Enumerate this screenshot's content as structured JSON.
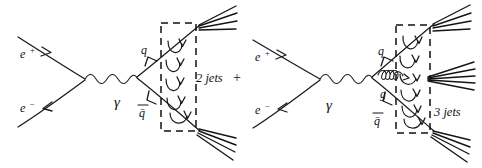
{
  "figure": {
    "background_color": "#ffffff",
    "ink_color": "#1a1a1a",
    "style": "hand-drawn sketch"
  },
  "diagrams": [
    {
      "id": "left-diagram",
      "name": "two-jet-diagram",
      "incoming": [
        {
          "name": "positron",
          "label": "e",
          "superscript": "+",
          "arrow": "inward"
        },
        {
          "name": "electron",
          "label": "e",
          "superscript": "−",
          "arrow": "inward"
        }
      ],
      "propagator": {
        "name": "photon",
        "label": "γ",
        "style": "wavy"
      },
      "outgoing": [
        {
          "name": "quark",
          "label": "q",
          "arrow": "outward"
        },
        {
          "name": "antiquark",
          "label": "q̄",
          "arrow": "inward"
        }
      ],
      "hadronization_box": {
        "label": "",
        "style": "dashed"
      },
      "result_label": "2 jets",
      "operator_label": "+",
      "jet_count": 2,
      "jet_bundles": [
        {
          "name": "upper-jet",
          "lines": 4
        },
        {
          "name": "lower-jet",
          "lines": 4
        }
      ],
      "hadronization_hooks": 5
    },
    {
      "id": "right-diagram",
      "name": "three-jet-diagram",
      "incoming": [
        {
          "name": "positron",
          "label": "e",
          "superscript": "+",
          "arrow": "inward"
        },
        {
          "name": "electron",
          "label": "e",
          "superscript": "−",
          "arrow": "inward"
        }
      ],
      "propagator": {
        "name": "photon",
        "label": "γ",
        "style": "wavy"
      },
      "outgoing": [
        {
          "name": "quark",
          "label": "q",
          "arrow": "outward"
        },
        {
          "name": "gluon",
          "label": "g",
          "arrow": "none",
          "style": "coil"
        },
        {
          "name": "antiquark",
          "label": "q̄",
          "arrow": "inward"
        }
      ],
      "hadronization_box": {
        "label": "",
        "style": "dashed"
      },
      "result_label": "3 jets",
      "jet_count": 3,
      "jet_bundles": [
        {
          "name": "upper-jet",
          "lines": 4
        },
        {
          "name": "middle-jet",
          "lines": 5
        },
        {
          "name": "lower-jet",
          "lines": 4
        }
      ],
      "hadronization_hooks": 6
    }
  ]
}
